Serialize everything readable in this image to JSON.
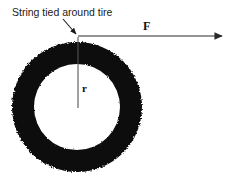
{
  "figure": {
    "title_annotation": "String tied around tire",
    "force_label": "F",
    "radius_label": "r",
    "colors": {
      "tire": "#0b0b0b",
      "hub": "#ffffff",
      "background": "#ffffff",
      "line": "#2a2a2a",
      "text": "#1a1a1a"
    },
    "geometry": {
      "center_x": 77,
      "center_y": 107,
      "outer_radius": 66,
      "inner_radius": 43,
      "force_arrow_y": 36,
      "force_arrow_x_start": 78,
      "force_arrow_x_end": 226,
      "radius_line_x": 78,
      "radius_line_y_top": 37,
      "radius_line_y_bottom": 108,
      "leader_start_x": 64,
      "leader_start_y": 20,
      "leader_end_x": 77,
      "leader_end_y": 35
    }
  }
}
